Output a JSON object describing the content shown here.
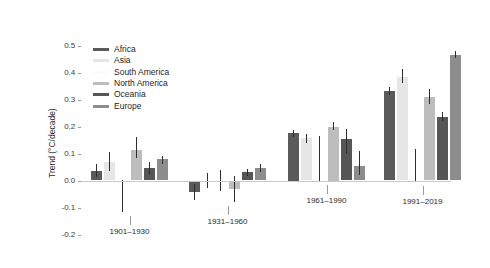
{
  "chart_data": {
    "type": "bar",
    "title": "",
    "subtitle": "",
    "xlabel": "",
    "ylabel": "Trend (°C/decade)",
    "categories": [
      "1901–1930",
      "1931–1960",
      "1961–1990",
      "1991–2019"
    ],
    "ylim": [
      -0.25,
      0.55
    ],
    "yticks": [
      0.5,
      0.4,
      0.3,
      0.2,
      0.1,
      0.0,
      -0.1,
      -0.2
    ],
    "ytick_labels": [
      "0.5",
      "0.4",
      "0.3",
      "0.2",
      "0.1",
      "0.0",
      "-0.1",
      "-0.2"
    ],
    "grid": false,
    "legend_position": "upper left",
    "error_bars": true,
    "series": [
      {
        "name": "Africa",
        "color": "#5a5a5a",
        "values": [
          0.035,
          -0.042,
          0.175,
          0.33
        ],
        "err_low": [
          0.012,
          -0.072,
          0.162,
          0.318
        ],
        "err_high": [
          0.06,
          -0.012,
          0.188,
          0.345
        ]
      },
      {
        "name": "Asia",
        "color": "#e6e6e6",
        "values": [
          0.07,
          0.0,
          0.158,
          0.385
        ],
        "err_low": [
          0.036,
          -0.028,
          0.138,
          0.36
        ],
        "err_high": [
          0.105,
          0.028,
          0.172,
          0.412
        ]
      },
      {
        "name": "South America",
        "color": "#fbfbfb",
        "values": [
          0.0,
          0.0,
          0.0,
          0.0
        ],
        "err_low": [
          -0.118,
          -0.04,
          -0.002,
          -0.005
        ],
        "err_high": [
          0.002,
          0.04,
          0.165,
          0.115
        ]
      },
      {
        "name": "North America",
        "color": "#bdbdbd",
        "values": [
          0.112,
          -0.03,
          0.2,
          0.31
        ],
        "err_low": [
          0.082,
          -0.078,
          0.188,
          0.285
        ],
        "err_high": [
          0.16,
          0.018,
          0.215,
          0.34
        ]
      },
      {
        "name": "Oceania",
        "color": "#565656",
        "values": [
          0.045,
          0.03,
          0.155,
          0.235
        ],
        "err_low": [
          0.022,
          0.018,
          0.098,
          0.222
        ],
        "err_high": [
          0.068,
          0.042,
          0.192,
          0.252
        ]
      },
      {
        "name": "Europe",
        "color": "#8d8d8d",
        "values": [
          0.078,
          0.045,
          0.055,
          0.465
        ],
        "err_low": [
          0.062,
          0.03,
          0.022,
          0.455
        ],
        "err_high": [
          0.092,
          0.06,
          0.108,
          0.478
        ]
      }
    ]
  },
  "legend": {
    "items": [
      {
        "label": "Africa",
        "color": "#5a5a5a"
      },
      {
        "label": "Asia",
        "color": "#e6e6e6"
      },
      {
        "label": "South America",
        "color": "#fbfbfb"
      },
      {
        "label": "North America",
        "color": "#bdbdbd"
      },
      {
        "label": "Oceania",
        "color": "#565656"
      },
      {
        "label": "Europe",
        "color": "#8d8d8d"
      }
    ]
  },
  "axis": {
    "y_title": "Trend (°C/decade)",
    "zero_line_color": "#c9c9c9",
    "tick_color": "#9a9a9a",
    "text_color": "#2b2b2b"
  }
}
